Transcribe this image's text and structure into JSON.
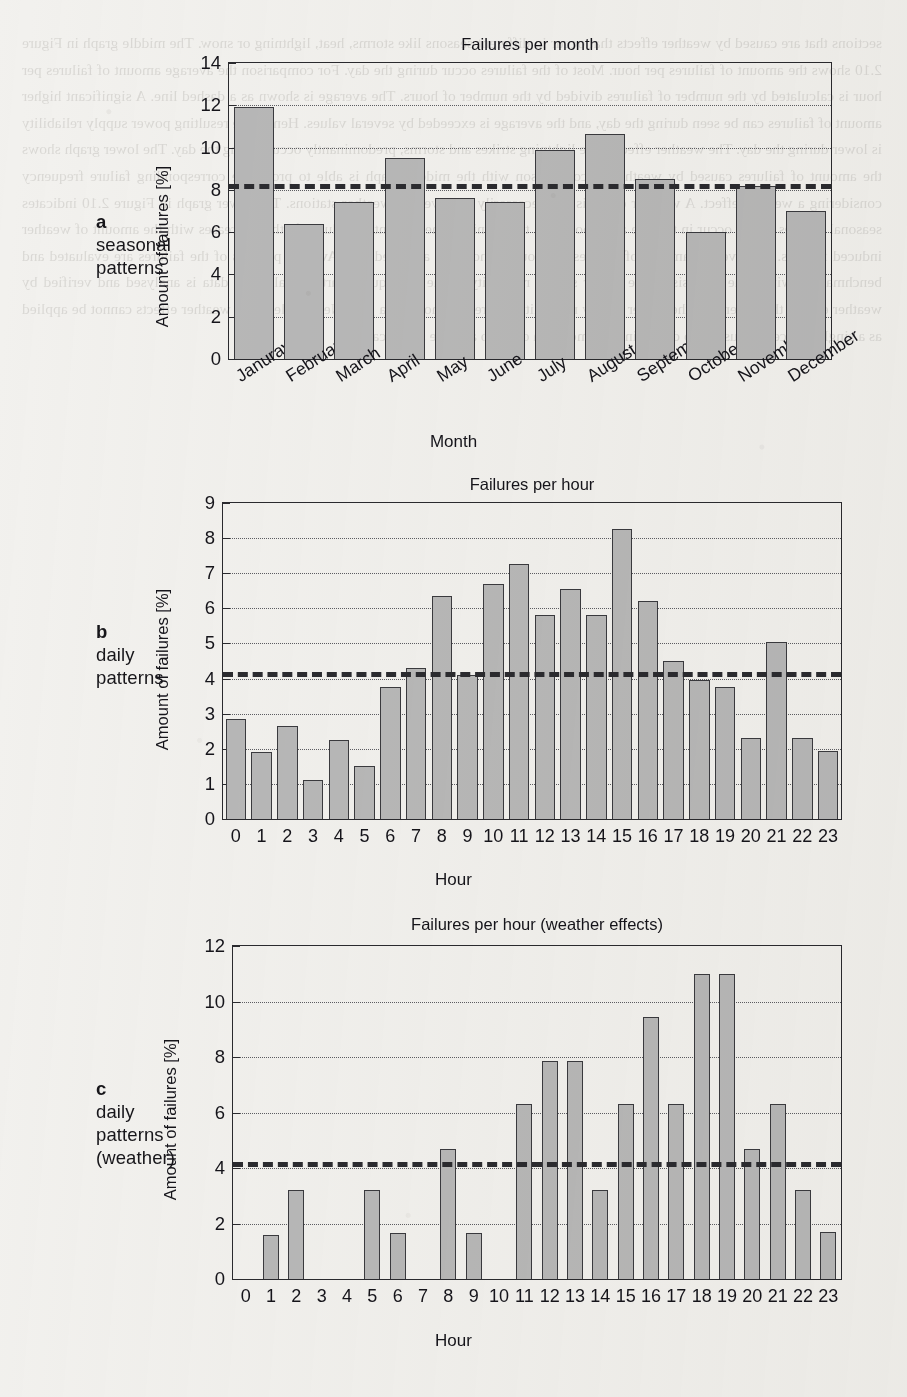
{
  "figure": {
    "background_color": "#f2f1ee",
    "bar_fill": "#b8b8b8",
    "bar_edge": "#3a3a3e",
    "axis_color": "#2a2a2e",
    "mean_line_color": "#2b2b2f"
  },
  "ghost_text": "sections that are caused by weather effects that occur in different seasons like storms, heat, lightning or snow. The middle graph in Figure 2.10 shows the amount of failures per hour. Most of the failures occur during the day. For comparison the average amount of failures per hour is calculated by the number of failures divided by the number of hours. The average is shown as a dashed line. A significant higher amount of failures can be seen during the day, and the average is exceeded by several values. Hence, the resulting power supply reliability is lower during the day. The weather effects, like lightning strikes and storms, predominantly occur during the day. The lower graph shows the amount of failures caused by weather. A comparison with the middle graph is able to prove the corresponding failure frequency considering a weather effect. A weather effect is not necessarily observed by weather stations. The lower graph in Figure 2.10 indicates seasonal failures which occur in the late afternoon or in the evening. The amount of failures further increases with the amount of weather induced failures. The average amount of failures per hour is shown as a dashed line. Average patterns of the failures are evaluated and benchmarked within the analysis of the power supply reliability in the subsequent parts. Finally, the data is analysed and verified by weather effects that determine the power supply reliability by creating noise in a grid. Nevertheless, the weather effects cannot be applied as a single source. It is useful to determine an amount in order to achieve significance.",
  "panels": [
    {
      "id": "a",
      "caption_letter": "a",
      "caption_lines": [
        "seasonal",
        "patterns"
      ],
      "chart_data": {
        "type": "bar",
        "title": "Failures per month",
        "xlabel": "Month",
        "ylabel": "Amount of failures [%]",
        "categories": [
          "Januray",
          "February",
          "March",
          "April",
          "May",
          "June",
          "July",
          "August",
          "September",
          "October",
          "November",
          "December"
        ],
        "values": [
          11.9,
          6.4,
          7.45,
          9.5,
          7.6,
          7.45,
          9.9,
          10.65,
          8.5,
          6.0,
          8.2,
          7.0
        ],
        "ylim": [
          0,
          14
        ],
        "yticks": [
          0,
          2,
          4,
          6,
          8,
          10,
          12,
          14
        ],
        "gridlines": [
          2,
          4,
          6,
          8,
          10,
          12
        ],
        "mean_line": 8.3,
        "grid": true,
        "legend": "none"
      }
    },
    {
      "id": "b",
      "caption_letter": "b",
      "caption_lines": [
        "daily",
        "patterns"
      ],
      "chart_data": {
        "type": "bar",
        "title": "Failures per hour",
        "xlabel": "Hour",
        "ylabel": "Amount of failures [%]",
        "categories": [
          "0",
          "1",
          "2",
          "3",
          "4",
          "5",
          "6",
          "7",
          "8",
          "9",
          "10",
          "11",
          "12",
          "13",
          "14",
          "15",
          "16",
          "17",
          "18",
          "19",
          "20",
          "21",
          "22",
          "23"
        ],
        "values": [
          2.85,
          1.9,
          2.65,
          1.1,
          2.25,
          1.5,
          3.75,
          4.3,
          6.35,
          4.1,
          6.7,
          7.25,
          5.8,
          6.55,
          5.8,
          8.25,
          6.2,
          4.5,
          3.95,
          3.75,
          2.3,
          5.05,
          2.3,
          1.95
        ],
        "ylim": [
          0,
          9
        ],
        "yticks": [
          0,
          1,
          2,
          3,
          4,
          5,
          6,
          7,
          8,
          9
        ],
        "gridlines": [
          1,
          2,
          3,
          4,
          5,
          6,
          7,
          8
        ],
        "mean_line": 4.2,
        "grid": true,
        "legend": "none"
      }
    },
    {
      "id": "c",
      "caption_letter": "c",
      "caption_lines": [
        "daily",
        "patterns",
        "(weather)"
      ],
      "chart_data": {
        "type": "bar",
        "title": "Failures per hour (weather effects)",
        "xlabel": "Hour",
        "ylabel": "Amount of failures [%]",
        "categories": [
          "0",
          "1",
          "2",
          "3",
          "4",
          "5",
          "6",
          "7",
          "8",
          "9",
          "10",
          "11",
          "12",
          "13",
          "14",
          "15",
          "16",
          "17",
          "18",
          "19",
          "20",
          "21",
          "22",
          "23"
        ],
        "values": [
          0,
          1.6,
          3.2,
          0,
          0,
          3.2,
          1.65,
          0,
          4.7,
          1.65,
          0,
          6.3,
          7.85,
          7.85,
          3.2,
          6.3,
          9.45,
          6.3,
          11.0,
          11.0,
          4.7,
          6.3,
          3.2,
          1.7
        ],
        "ylim": [
          0,
          12
        ],
        "yticks": [
          0,
          2,
          4,
          6,
          8,
          10,
          12
        ],
        "gridlines": [
          2,
          4,
          6,
          8,
          10
        ],
        "mean_line": 4.2,
        "grid": true,
        "legend": "none"
      }
    }
  ]
}
